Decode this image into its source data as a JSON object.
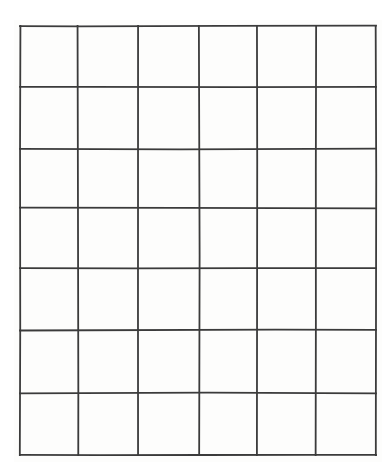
{
  "document": {
    "kind": "blank-grid-worksheet",
    "description": "Blank rectangular grid / table with empty cells",
    "medium": "scanned paper"
  },
  "canvas": {
    "width": 391,
    "height": 472,
    "background_color": "#ffffff"
  },
  "grid": {
    "columns": 6,
    "rows": 7,
    "cell_count": 42,
    "line_color": "#3b3b3b",
    "line_width": 1.8,
    "cell_fill": "#fdfdfc",
    "bounds": {
      "left": 20,
      "top": 26,
      "right": 376,
      "bottom": 455,
      "width": 356,
      "height": 429
    },
    "vertical_line_x": [
      20,
      78,
      138,
      199,
      257,
      316,
      376
    ],
    "horizontal_line_y": [
      26,
      87,
      149,
      208,
      268,
      330,
      393,
      455
    ],
    "column_widths": [
      58,
      60,
      61,
      58,
      59,
      60
    ],
    "row_heights": [
      61,
      62,
      59,
      60,
      62,
      63,
      62
    ],
    "cells": [
      [
        "",
        "",
        "",
        "",
        "",
        ""
      ],
      [
        "",
        "",
        "",
        "",
        "",
        ""
      ],
      [
        "",
        "",
        "",
        "",
        "",
        ""
      ],
      [
        "",
        "",
        "",
        "",
        "",
        ""
      ],
      [
        "",
        "",
        "",
        "",
        "",
        ""
      ],
      [
        "",
        "",
        "",
        "",
        "",
        ""
      ],
      [
        "",
        "",
        "",
        "",
        "",
        ""
      ]
    ]
  }
}
